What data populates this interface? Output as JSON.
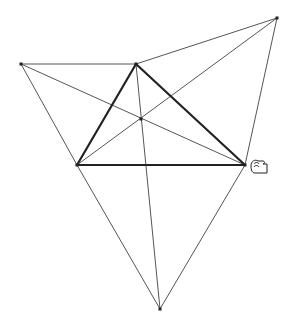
{
  "diagram": {
    "points": {
      "A": [
        21,
        64
      ],
      "B": [
        136,
        64
      ],
      "C": [
        277,
        18
      ],
      "L": [
        77,
        165
      ],
      "R": [
        245,
        165
      ],
      "D": [
        160,
        309
      ],
      "M": [
        141,
        119
      ]
    },
    "thin_lines": [
      [
        "A",
        "B"
      ],
      [
        "B",
        "C"
      ],
      [
        "A",
        "L"
      ],
      [
        "C",
        "R"
      ],
      [
        "L",
        "D"
      ],
      [
        "R",
        "D"
      ],
      [
        "A",
        "R"
      ],
      [
        "C",
        "L"
      ],
      [
        "B",
        "D"
      ]
    ],
    "thick_lines": [
      [
        "B",
        "L"
      ],
      [
        "B",
        "R"
      ],
      [
        "L",
        "R"
      ]
    ],
    "colors": {
      "line": "#555555",
      "thick": "#222222",
      "point": "#222222"
    }
  },
  "cursor": {
    "icon": "hand-grab-cursor",
    "position": [
      251,
      160
    ]
  }
}
